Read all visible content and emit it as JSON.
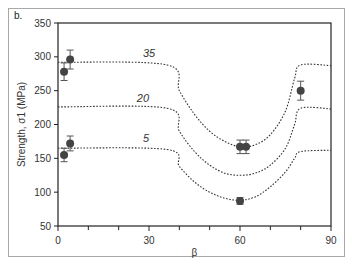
{
  "panel_label": "b.",
  "chart_data": {
    "type": "scatter",
    "title": "",
    "xlabel": "β",
    "ylabel": "Strength, σ1 (MPa)",
    "xlim": [
      0,
      90
    ],
    "ylim": [
      50,
      350
    ],
    "xticks": [
      0,
      30,
      60,
      90
    ],
    "xminor": [
      10,
      20,
      40,
      50,
      70,
      80
    ],
    "yticks": [
      50,
      100,
      150,
      200,
      250,
      300,
      350
    ],
    "grid": false,
    "series": [
      {
        "name": "measured",
        "type": "scatter",
        "points": [
          {
            "x": 2,
            "y": 278,
            "err": 13
          },
          {
            "x": 4,
            "y": 296,
            "err": 14
          },
          {
            "x": 2,
            "y": 155,
            "err": 10
          },
          {
            "x": 4,
            "y": 172,
            "err": 11
          },
          {
            "x": 60,
            "y": 167,
            "err": 10
          },
          {
            "x": 62,
            "y": 167,
            "err": 10
          },
          {
            "x": 60,
            "y": 87,
            "err": 5
          },
          {
            "x": 80,
            "y": 250,
            "err": 14
          }
        ]
      },
      {
        "name": "35",
        "type": "line",
        "style": "dotted",
        "x": [
          0,
          36,
          40,
          45,
          50,
          55,
          60,
          65,
          70,
          75,
          78,
          80,
          90
        ],
        "y": [
          292,
          288,
          250,
          215,
          190,
          175,
          167,
          170,
          185,
          220,
          268,
          288,
          287
        ]
      },
      {
        "name": "20",
        "type": "line",
        "style": "dotted",
        "x": [
          0,
          36,
          40,
          45,
          50,
          55,
          60,
          65,
          70,
          75,
          78,
          80,
          90
        ],
        "y": [
          226,
          224,
          190,
          160,
          140,
          128,
          125,
          128,
          140,
          165,
          200,
          224,
          223
        ]
      },
      {
        "name": "5",
        "type": "line",
        "style": "dotted",
        "x": [
          0,
          36,
          40,
          45,
          50,
          55,
          60,
          65,
          70,
          75,
          78,
          80,
          90
        ],
        "y": [
          165,
          163,
          138,
          115,
          100,
          91,
          88,
          93,
          108,
          130,
          150,
          160,
          162
        ]
      }
    ],
    "annotations": [
      {
        "text": "35",
        "x": 30,
        "y": 300
      },
      {
        "text": "20",
        "x": 28,
        "y": 233
      },
      {
        "text": "5",
        "x": 29,
        "y": 174
      }
    ]
  }
}
